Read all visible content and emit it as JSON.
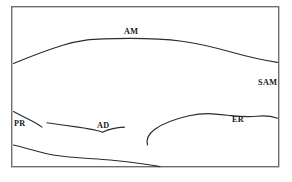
{
  "figure": {
    "kind": "cross-section-line-drawing",
    "background_color": "#ffffff",
    "frame": {
      "stroke_color": "#6e6e72",
      "stroke_width": 1.4,
      "x": 11,
      "y": 6,
      "width": 268,
      "height": 161
    },
    "line_color": "#2b2b2f",
    "line_width": 1.15
  },
  "labels": {
    "am": "AM",
    "sam": "SAM",
    "pr": "PR",
    "ad": "AD",
    "er": "ER"
  },
  "curves": {
    "am": {
      "name": "AM",
      "label": "AM",
      "path": "M 13.5 63.5 C 28 57.5, 46 50.5, 62 45.5 C 71 42.7, 79 41.0, 86 40.1 C 96 39.0, 112 38.5, 130 38.4 C 150 38.4, 168 39.4, 182 41.2 C 198 43.4, 214 47.2, 231 52.0 C 248 56.8, 264 60.3, 277.5 62.4"
    },
    "sam": {
      "name": "SAM",
      "label": "SAM",
      "path": "M 147.5 145.0 C 146.2 140.0, 148.5 134.0, 154.5 129.5 C 162 124.0, 176 118.8, 189 115.8 C 196 114.2, 203 113.6, 208 113.6 C 214 113.6, 222 114.6, 231 115.6 C 240 116.6, 249 117.0, 257 116.2 C 265 115.4, 272 116.3, 277.5 118.2"
    },
    "pr": {
      "name": "PR",
      "label": "PR",
      "path": "M 13.5 111.5 C 19 114.5, 26 118.0, 32 121.0 C 36 123.1, 39.5 125.3, 42.0 127.1"
    },
    "ad": {
      "name": "AD",
      "label": "AD",
      "path": "M 47.0 122.8 C 57 124.2, 68 125.7, 78 127.1 C 85 128.1, 91 129.0, 96 130.3 C 99 131.0, 101 131.6, 102.5 132.3 C 105 131.0, 109 129.5, 113 128.6 C 117 127.7, 121 127.3, 124.5 127.1"
    },
    "lower_boundary": {
      "name": "lower-boundary",
      "label": "",
      "path": "M 13.5 145.0 C 22 147.0, 31 149.5, 39 151.8 C 48 154.3, 58 156.0, 69 157.0 C 82 158.2, 96 158.9, 110 160.0 C 124 161.1, 138 163.0, 149 164.8 C 154 165.7, 158 166.3, 160 166.7"
    }
  }
}
